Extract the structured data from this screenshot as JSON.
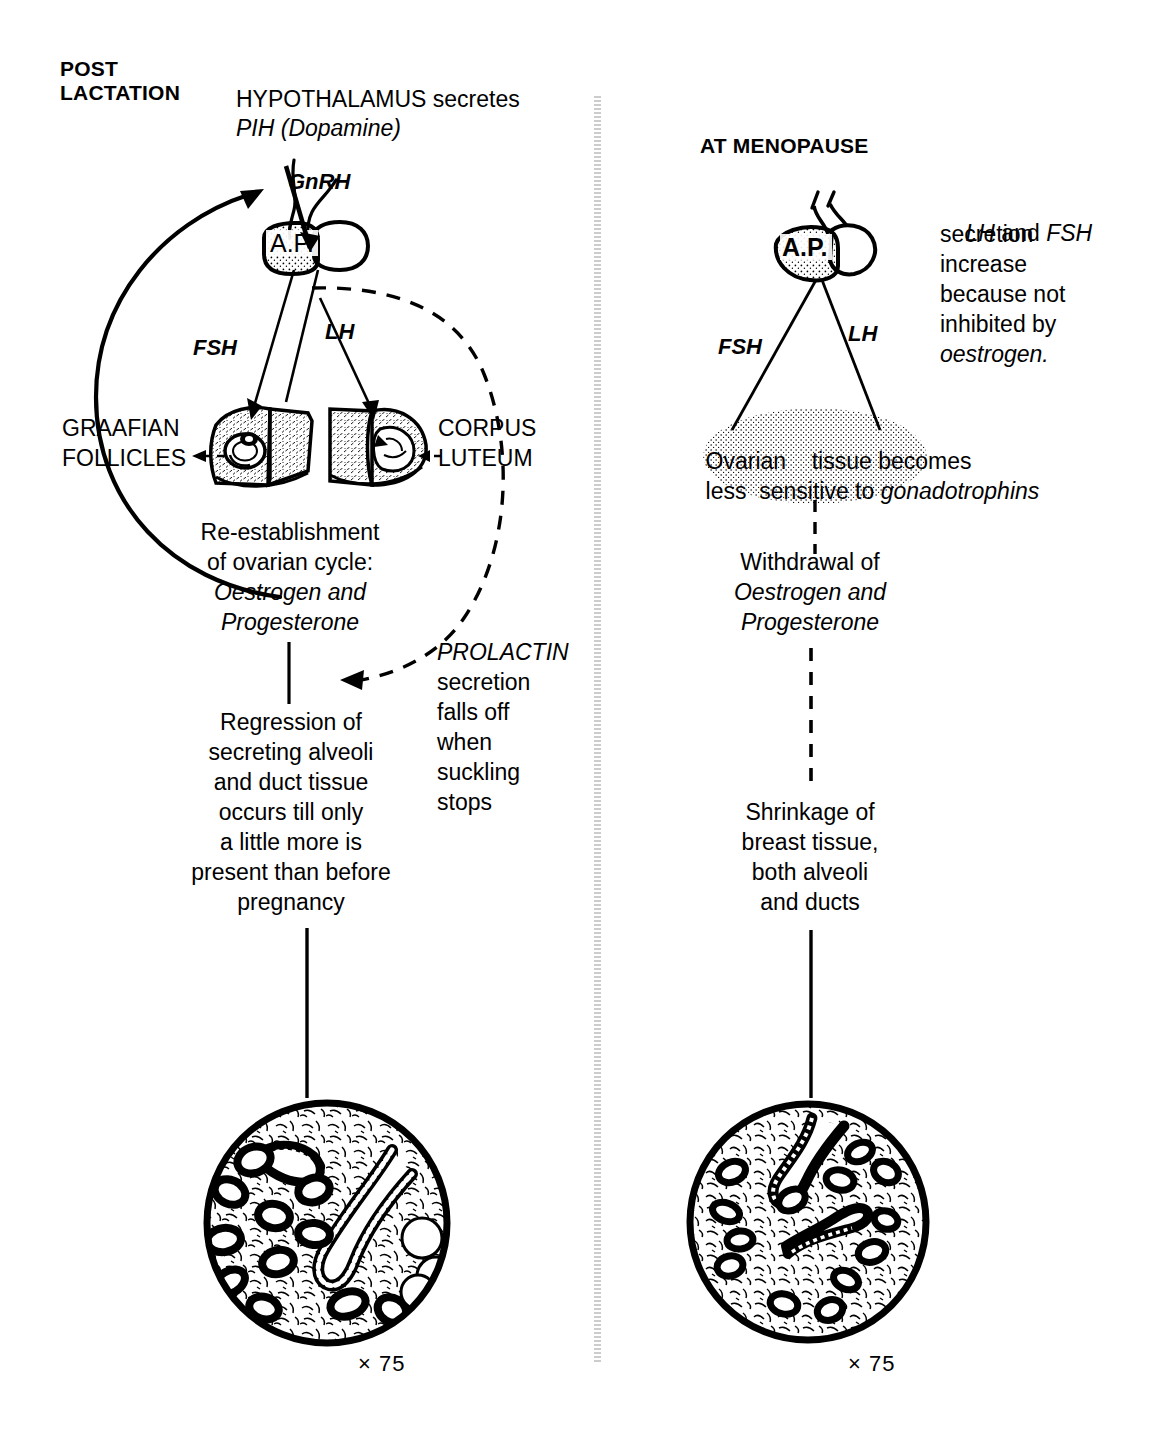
{
  "figure": {
    "type": "biological-flow-diagram",
    "title_left": "POST LACTATION",
    "title_right": "AT MENOPAUSE"
  },
  "left_column": {
    "heading_line1": "POST",
    "heading_line2": "LACTATION",
    "hypothalamus_line1": "HYPOTHALAMUS secretes",
    "hypothalamus_line2": "PIH (Dopamine)",
    "gnrh_label": "GnRH",
    "pituitary_label": "A.P.",
    "fsh_label": "FSH",
    "lh_label": "LH",
    "graafian_line1": "GRAAFIAN",
    "graafian_line2": "FOLLICLES",
    "corpus_line1": "CORPUS",
    "corpus_line2": "LUTEUM",
    "reestablishment": [
      "Re-establishment",
      "of ovarian cycle:",
      "Oestrogen and",
      "Progesterone"
    ],
    "reestablishment_italic_lines": [
      2,
      3
    ],
    "prolactin": [
      "PROLACTIN",
      "secretion",
      "falls off",
      "when",
      "suckling",
      "stops"
    ],
    "prolactin_italic_lines": [
      0
    ],
    "regression": [
      "Regression of",
      "secreting alveoli",
      "and duct tissue",
      "occurs till only",
      "a little more is",
      "present than before",
      "pregnancy"
    ],
    "magnification": "× 75"
  },
  "right_column": {
    "heading": "AT MENOPAUSE",
    "pituitary_label": "A.P.",
    "fsh_label": "FSH",
    "lh_label": "LH",
    "note": [
      "LH and FSH",
      "secretion",
      "increase",
      "because not",
      "inhibited by",
      "oestrogen."
    ],
    "ovarian_line1": "Ovarian     tissue becomes",
    "ovarian_line2": "less   sensitive to gonadotrophins",
    "ovarian_line1_plain": "Ovarian",
    "ovarian_line1_plain2": "tissue becomes",
    "ovarian_line2_plain": "less",
    "ovarian_line2_plain2": "sensitive to",
    "ovarian_line2_italic": "gonadotrophins",
    "withdrawal": [
      "Withdrawal of",
      "Oestrogen and",
      "Progesterone"
    ],
    "withdrawal_italic_lines": [
      1,
      2
    ],
    "shrinkage": [
      "Shrinkage of",
      "breast tissue,",
      "both alveoli",
      "and ducts"
    ],
    "magnification": "× 75"
  },
  "colors": {
    "ink": "#000000",
    "paper": "#ffffff",
    "divider": "#8c8c8c"
  }
}
